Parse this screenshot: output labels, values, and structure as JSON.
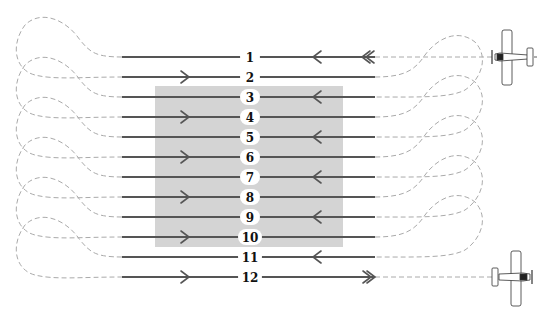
{
  "diagram": {
    "title_fragment": "",
    "colors": {
      "pass_line": "#555555",
      "turn_path": "#aaaaaa",
      "target_area": "#d4d4d4",
      "label_bg": "#ffffff",
      "label_text": "#111111"
    },
    "target_area": {
      "x": 155,
      "y": 86,
      "width": 188,
      "height": 161
    },
    "passes": [
      {
        "number": "1",
        "y": 57,
        "direction": "left",
        "marker": "double-arrow-entry"
      },
      {
        "number": "2",
        "y": 77,
        "direction": "right",
        "marker": "arrow"
      },
      {
        "number": "3",
        "y": 97,
        "direction": "left",
        "marker": "arrow"
      },
      {
        "number": "4",
        "y": 117,
        "direction": "right",
        "marker": "arrow"
      },
      {
        "number": "5",
        "y": 137,
        "direction": "left",
        "marker": "arrow"
      },
      {
        "number": "6",
        "y": 157,
        "direction": "right",
        "marker": "arrow"
      },
      {
        "number": "7",
        "y": 177,
        "direction": "left",
        "marker": "arrow"
      },
      {
        "number": "8",
        "y": 197,
        "direction": "right",
        "marker": "arrow"
      },
      {
        "number": "9",
        "y": 217,
        "direction": "left",
        "marker": "arrow"
      },
      {
        "number": "10",
        "y": 237,
        "direction": "right",
        "marker": "arrow"
      },
      {
        "number": "11",
        "y": 257,
        "direction": "left",
        "marker": "arrow"
      },
      {
        "number": "12",
        "y": 277,
        "direction": "right",
        "marker": "double-arrow-exit"
      }
    ],
    "aircraft": [
      {
        "name": "entering-aircraft",
        "position": "top-right",
        "heading": "left"
      },
      {
        "name": "exiting-aircraft",
        "position": "bottom-right",
        "heading": "right"
      }
    ]
  }
}
